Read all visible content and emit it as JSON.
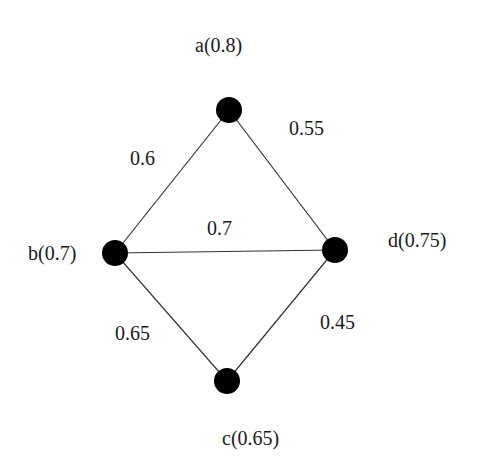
{
  "graph": {
    "nodes": [
      {
        "id": "a",
        "label": "a(0.8)",
        "x": 229,
        "y": 110,
        "lx": 195,
        "ly": 35
      },
      {
        "id": "b",
        "label": "b(0.7)",
        "x": 115,
        "y": 253,
        "lx": 28,
        "ly": 243
      },
      {
        "id": "c",
        "label": "c(0.65)",
        "x": 227,
        "y": 381,
        "lx": 222,
        "ly": 428
      },
      {
        "id": "d",
        "label": "d(0.75)",
        "x": 335,
        "y": 250,
        "lx": 388,
        "ly": 230
      }
    ],
    "edges": [
      {
        "from": "a",
        "to": "b",
        "weight": "0.6",
        "lx": 130,
        "ly": 148
      },
      {
        "from": "a",
        "to": "d",
        "weight": "0.55",
        "lx": 289,
        "ly": 118
      },
      {
        "from": "b",
        "to": "d",
        "weight": "0.7",
        "lx": 207,
        "ly": 218
      },
      {
        "from": "b",
        "to": "c",
        "weight": "0.65",
        "lx": 115,
        "ly": 323
      },
      {
        "from": "d",
        "to": "c",
        "weight": "0.45",
        "lx": 320,
        "ly": 312
      }
    ],
    "node_color": "#000000",
    "edge_color": "#333333"
  }
}
